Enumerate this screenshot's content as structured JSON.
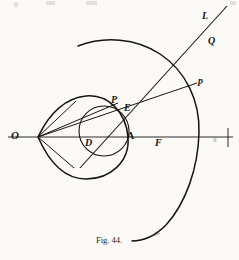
{
  "figure": {
    "caption": "Fig. 44.",
    "ink_color": "#171512",
    "paper_color": "#fbfaf7",
    "labels": [
      {
        "name": "origin-label-o",
        "text": "O",
        "x": 11,
        "y": 130,
        "size": 11
      },
      {
        "name": "point-label-d",
        "text": "D",
        "x": 85,
        "y": 138,
        "size": 10
      },
      {
        "name": "point-label-a",
        "text": "A",
        "x": 127,
        "y": 131,
        "size": 10
      },
      {
        "name": "point-label-f",
        "text": "F",
        "x": 155,
        "y": 138,
        "size": 10
      },
      {
        "name": "axis-label-x",
        "text": "x",
        "x": 213,
        "y": 136,
        "size": 8
      },
      {
        "name": "point-label-p-upper",
        "text": "P",
        "x": 111,
        "y": 95,
        "size": 10
      },
      {
        "name": "point-label-e",
        "text": "E",
        "x": 124,
        "y": 103,
        "size": 10
      },
      {
        "name": "point-label-p-lower",
        "text": "p",
        "x": 198,
        "y": 76,
        "size": 10
      },
      {
        "name": "line-label-l",
        "text": "L",
        "x": 202,
        "y": 11,
        "size": 10
      },
      {
        "name": "region-label-q",
        "text": "Q",
        "x": 208,
        "y": 36,
        "size": 10
      }
    ],
    "geometry": {
      "axis": {
        "x1": 8,
        "y1": 137,
        "x2": 233,
        "y2": 137
      },
      "axis_tick": {
        "x": 228,
        "y1": 128,
        "y2": 147
      },
      "origin": {
        "x": 38,
        "y": 137
      },
      "oval_cusp": {
        "x": 38,
        "y": 137
      },
      "oval_right": {
        "x": 128,
        "y": 137
      },
      "oval_top_y": 96,
      "oval_bottom_y": 179,
      "circle": {
        "cx": 104,
        "cy": 131,
        "r": 25
      },
      "outer_arc": {
        "cx": 120,
        "cy": 137,
        "r": 110
      },
      "line_l": {
        "x1": 80,
        "y1": 168,
        "x2": 227,
        "y2": 6
      },
      "ray_op": {
        "x1": 38,
        "y1": 137,
        "x2": 197,
        "y2": 83
      }
    }
  }
}
